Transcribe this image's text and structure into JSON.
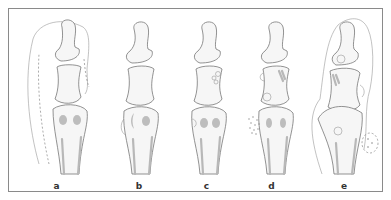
{
  "figure": {
    "panels": [
      {
        "id": "a",
        "label": "a",
        "description": "Toe phalanges and metatarsal head with soft-tissue outline and dashed line along medial side"
      },
      {
        "id": "b",
        "label": "b",
        "description": "Phalanges with metatarsal head showing crescent-shaped medial erosion"
      },
      {
        "id": "c",
        "label": "c",
        "description": "Phalanges with small cysts in proximal phalanx and medial metatarsal notch"
      },
      {
        "id": "d",
        "label": "d",
        "description": "Phalanges with cysts, erosions and stippled tophus at medial metatarsal head"
      },
      {
        "id": "e",
        "label": "e",
        "description": "Deformed joint with large soft-tissue swelling and dashed tophus beside metatarsal"
      }
    ],
    "colors": {
      "frame": "#8a8a8a",
      "bone_outline": "#777777",
      "bone_fill": "#f6f6f6",
      "shading": "#b8b8b8",
      "label": "#333333"
    }
  }
}
